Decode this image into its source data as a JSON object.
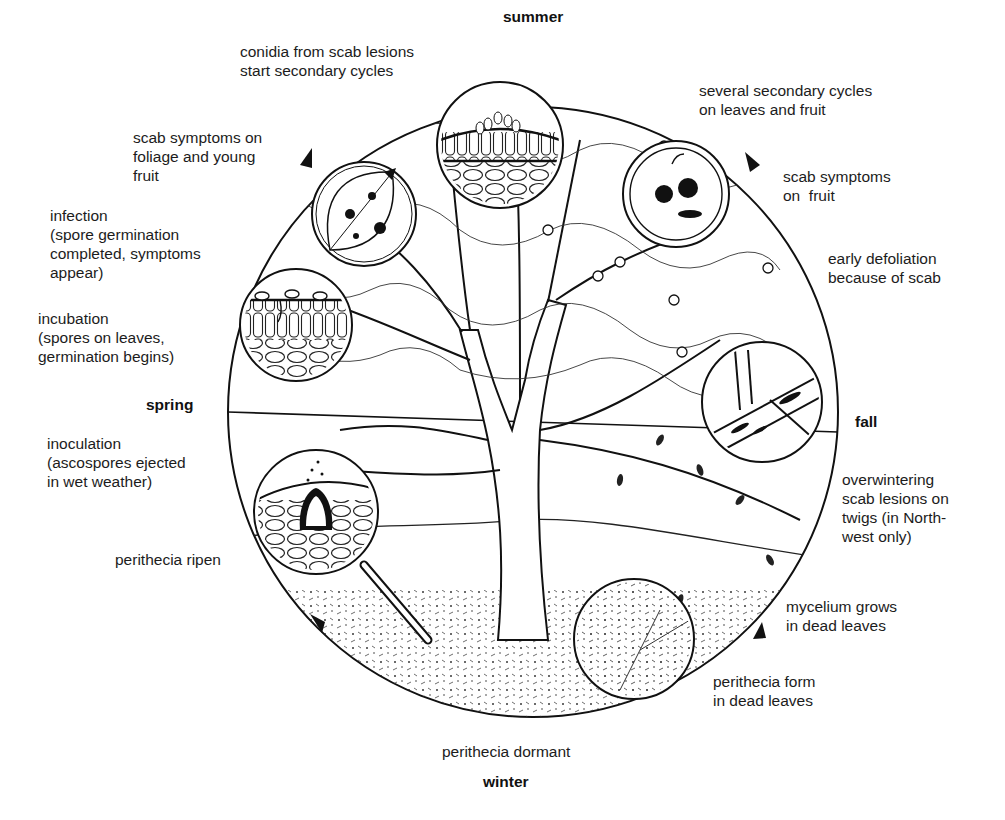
{
  "diagram": {
    "seasons": {
      "top": "summer",
      "right": "fall",
      "bottom": "winter",
      "left": "spring"
    },
    "stages": [
      {
        "id": "conidia",
        "text": "conidia from scab lesions\nstart secondary cycles"
      },
      {
        "id": "secondary-cycles",
        "text": "several secondary cycles\non leaves and fruit"
      },
      {
        "id": "symptoms-foliage",
        "text": "scab symptoms on\nfoliage and young\nfruit"
      },
      {
        "id": "symptoms-fruit",
        "text": "scab symptoms\non  fruit"
      },
      {
        "id": "infection",
        "text": "infection\n(spore germination\ncompleted, symptoms\nappear)"
      },
      {
        "id": "defoliation",
        "text": "early defoliation\nbecause of scab"
      },
      {
        "id": "incubation",
        "text": "incubation\n(spores on leaves,\ngermination begins)"
      },
      {
        "id": "inoculation",
        "text": "inoculation\n(ascospores ejected\nin wet weather)"
      },
      {
        "id": "overwintering",
        "text": "overwintering\nscab lesions on\ntwigs (in North-\nwest only)"
      },
      {
        "id": "perithecia-ripen",
        "text": "perithecia ripen"
      },
      {
        "id": "mycelium",
        "text": "mycelium grows\nin dead leaves"
      },
      {
        "id": "perithecia-form",
        "text": "perithecia form\nin dead leaves"
      },
      {
        "id": "perithecia-dormant",
        "text": "perithecia dormant"
      }
    ],
    "insets": [
      {
        "name": "conidia-on-leaf-inset",
        "depicts": "conidia on leaf surface"
      },
      {
        "name": "scab-leaf-inset",
        "depicts": "scab lesions on leaf"
      },
      {
        "name": "scab-fruit-inset",
        "depicts": "scab lesions on fruit"
      },
      {
        "name": "incubation-inset",
        "depicts": "spores germinating on leaf tissue"
      },
      {
        "name": "twig-lesions-inset",
        "depicts": "scab lesions on twig"
      },
      {
        "name": "perithecium-inset",
        "depicts": "perithecium ejecting ascospores"
      },
      {
        "name": "dead-leaf-inset",
        "depicts": "mycelium in dead leaf"
      }
    ],
    "colors": {
      "ink": "#1a1a1a",
      "paper": "#ffffff"
    }
  }
}
